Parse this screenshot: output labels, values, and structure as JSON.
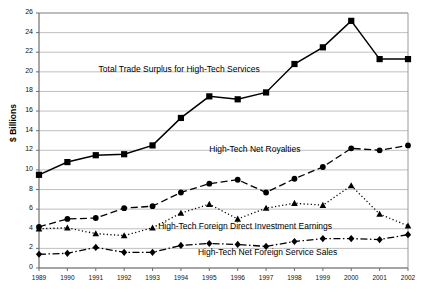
{
  "chart_data": {
    "type": "line",
    "title": "",
    "xlabel": "",
    "ylabel": "$ Billions",
    "grid": true,
    "legend_position": "inline-annotations",
    "xlim": [
      1989,
      2002
    ],
    "ylim": [
      0,
      26
    ],
    "ytick_step": 2,
    "categories": [
      1989,
      1990,
      1991,
      1992,
      1993,
      1994,
      1995,
      1996,
      1997,
      1998,
      1999,
      2000,
      2001,
      2002
    ],
    "xticks": [
      "1989",
      "1990",
      "1991",
      "1992",
      "1993",
      "1994",
      "1995",
      "1996",
      "1997",
      "1998",
      "1999",
      "2000",
      "2001",
      "2002"
    ],
    "yticks": [
      "0",
      "2",
      "4",
      "6",
      "8",
      "10",
      "12",
      "14",
      "16",
      "18",
      "20",
      "22",
      "24",
      "26"
    ],
    "series": [
      {
        "name": "Total Trade Surplus for High-Tech Services",
        "marker": "square",
        "line_style": "solid",
        "values": [
          9.5,
          10.8,
          11.5,
          11.6,
          12.5,
          15.3,
          17.5,
          17.2,
          17.9,
          20.8,
          22.5,
          25.2,
          21.3,
          21.3
        ]
      },
      {
        "name": "High-Tech Net Royalties",
        "marker": "circle",
        "line_style": "dashed",
        "values": [
          4.2,
          5.0,
          5.1,
          6.1,
          6.3,
          7.7,
          8.6,
          9.0,
          7.7,
          9.1,
          10.3,
          12.2,
          12.0,
          12.5
        ]
      },
      {
        "name": "High-Tech Foreign Direct Investment Earnings",
        "marker": "triangle",
        "line_style": "dotted",
        "values": [
          4.0,
          4.1,
          3.5,
          3.3,
          4.1,
          5.6,
          6.5,
          5.0,
          6.1,
          6.6,
          6.4,
          8.4,
          5.5,
          4.3
        ]
      },
      {
        "name": "High-Tech Net Foreign Service Sales",
        "marker": "diamond",
        "line_style": "dash-dot",
        "values": [
          1.4,
          1.5,
          2.1,
          1.6,
          1.6,
          2.3,
          2.5,
          2.4,
          2.2,
          2.7,
          3.0,
          3.0,
          2.9,
          3.4
        ]
      }
    ],
    "annotations": [
      {
        "text": "Total Trade Surplus for High-Tech Services",
        "x": 1991.1,
        "y": 20.2
      },
      {
        "text": "High-Tech Net Royalties",
        "x": 1995.0,
        "y": 12.0
      },
      {
        "text": "High-Tech Foreign Direct Investment Earnings",
        "x": 1993.2,
        "y": 4.2
      },
      {
        "text": "High-Tech Net Foreign Service Sales",
        "x": 1994.6,
        "y": 1.5
      }
    ]
  },
  "colors": {
    "series": "#000000",
    "grid": "#b9b9b9",
    "axis": "#7a7a7a",
    "background": "#ffffff"
  }
}
